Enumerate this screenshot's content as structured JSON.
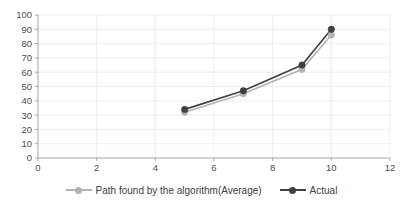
{
  "chart_data": {
    "type": "line",
    "title": "",
    "xlabel": "",
    "ylabel": "",
    "xlim": [
      0,
      12
    ],
    "ylim": [
      0,
      100
    ],
    "x_ticks": [
      0,
      2,
      4,
      6,
      8,
      10,
      12
    ],
    "y_ticks": [
      0,
      10,
      20,
      30,
      40,
      50,
      60,
      70,
      80,
      90,
      100
    ],
    "grid": true,
    "legend_position": "bottom",
    "x": [
      5,
      7,
      9,
      10
    ],
    "series": [
      {
        "name": "Path found by the algorithm(Average)",
        "values": [
          32,
          45,
          62,
          86
        ],
        "color": "#b3b3b3",
        "marker": "circle"
      },
      {
        "name": "Actual",
        "values": [
          34,
          47,
          65,
          90
        ],
        "color": "#404040",
        "marker": "circle"
      }
    ]
  },
  "legend": {
    "items": [
      {
        "label": "Path found by the algorithm(Average)",
        "color": "#b3b3b3"
      },
      {
        "label": "Actual",
        "color": "#404040"
      }
    ]
  },
  "axis_colors": {
    "grid": "#e8e8e8",
    "axis": "#a6a6a6",
    "tick_text": "#4d4d4d"
  }
}
